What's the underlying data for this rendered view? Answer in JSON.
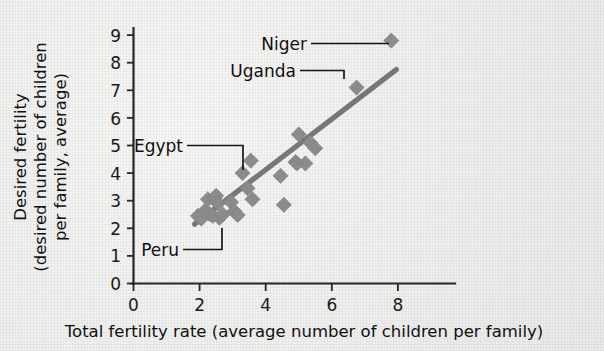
{
  "chart_data": {
    "type": "scatter",
    "title": "",
    "xlabel": "Total fertility rate (average number of children per family)",
    "ylabel_lines": [
      "Desired fertility",
      "(desired number of children",
      "per family, average)"
    ],
    "ylabel": "Desired fertility (desired number of children per family, average)",
    "xlim": [
      0,
      9.2
    ],
    "ylim": [
      0,
      9.4
    ],
    "xticks": [
      0,
      2,
      4,
      6,
      8
    ],
    "yticks": [
      0,
      1,
      2,
      3,
      4,
      5,
      6,
      7,
      8,
      9
    ],
    "xticklabels": [
      "0",
      "2",
      "4",
      "6",
      "8"
    ],
    "yticklabels": [
      "0",
      "1",
      "2",
      "3",
      "4",
      "5",
      "6",
      "7",
      "8",
      "9"
    ],
    "grid": false,
    "legend": null,
    "marker_shape": "diamond",
    "marker_color": "#8b8b8b",
    "trendline": {
      "color": "#777777",
      "x_start": 1.85,
      "y_start": 2.15,
      "x_end": 7.95,
      "y_end": 7.75
    },
    "points": [
      {
        "x": 1.95,
        "y": 2.45
      },
      {
        "x": 2.05,
        "y": 2.35
      },
      {
        "x": 2.15,
        "y": 2.62
      },
      {
        "x": 2.25,
        "y": 3.05
      },
      {
        "x": 2.3,
        "y": 2.52
      },
      {
        "x": 2.4,
        "y": 2.45
      },
      {
        "x": 2.45,
        "y": 3.1
      },
      {
        "x": 2.5,
        "y": 3.18
      },
      {
        "x": 2.55,
        "y": 2.9
      },
      {
        "x": 2.6,
        "y": 2.38
      },
      {
        "x": 2.7,
        "y": 2.5
      },
      {
        "x": 2.95,
        "y": 2.95
      },
      {
        "x": 3.05,
        "y": 2.62
      },
      {
        "x": 3.15,
        "y": 2.48
      },
      {
        "x": 3.3,
        "y": 4.0
      },
      {
        "x": 3.45,
        "y": 3.45
      },
      {
        "x": 3.55,
        "y": 4.45
      },
      {
        "x": 3.6,
        "y": 3.05
      },
      {
        "x": 4.45,
        "y": 3.9
      },
      {
        "x": 4.55,
        "y": 2.85
      },
      {
        "x": 4.9,
        "y": 4.4
      },
      {
        "x": 4.95,
        "y": 4.35
      },
      {
        "x": 5.0,
        "y": 5.4
      },
      {
        "x": 5.2,
        "y": 4.35
      },
      {
        "x": 5.35,
        "y": 5.1
      },
      {
        "x": 5.5,
        "y": 4.9
      },
      {
        "x": 6.75,
        "y": 7.1
      },
      {
        "x": 7.8,
        "y": 8.8
      }
    ],
    "annotations": [
      {
        "label": "Niger",
        "target_x": 7.8,
        "target_y": 8.8,
        "kind": "straight-leader"
      },
      {
        "label": "Uganda",
        "target_x": 6.75,
        "target_y": 7.1,
        "kind": "elbow-leader"
      },
      {
        "label": "Egypt",
        "target_x": 3.3,
        "target_y": 4.0,
        "kind": "elbow-leader"
      },
      {
        "label": "Peru",
        "target_x": 2.7,
        "target_y": 2.5,
        "kind": "elbow-leader"
      }
    ]
  },
  "labels": {
    "niger": "Niger",
    "uganda": "Uganda",
    "egypt": "Egypt",
    "peru": "Peru",
    "xaxis_title": "Total fertility rate (average number of children per family)",
    "yaxis_line1": "Desired fertility",
    "yaxis_line2": "(desired number of children",
    "yaxis_line3": "per family, average)",
    "x_tick_0": "0",
    "x_tick_2": "2",
    "x_tick_4": "4",
    "x_tick_6": "6",
    "x_tick_8": "8",
    "y_tick_0": "0",
    "y_tick_1": "1",
    "y_tick_2": "2",
    "y_tick_3": "3",
    "y_tick_4": "4",
    "y_tick_5": "5",
    "y_tick_6": "6",
    "y_tick_7": "7",
    "y_tick_8": "8",
    "y_tick_9": "9"
  }
}
